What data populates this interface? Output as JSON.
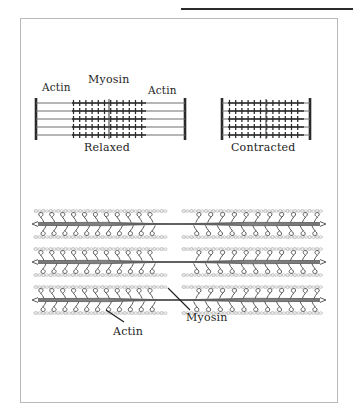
{
  "page": {
    "background_color": "#ffffff",
    "rule_color": "#2b2b2b",
    "frame_color": "#b9b9b9"
  },
  "figure": {
    "frame": {
      "x": 20,
      "y": 18,
      "width": 318,
      "height": 385
    }
  },
  "top_panel": {
    "relaxed": {
      "caption": "Relaxed",
      "labels": {
        "actin_left": "Actin",
        "myosin": "Myosin",
        "actin_right": "Actin"
      },
      "z_line_left_x": 36,
      "z_line_right_x": 185,
      "filament_count": 5,
      "myosin_band": {
        "start_x": 72,
        "end_x": 146
      },
      "m_line_x": 109,
      "line_color": "#6f6f6f",
      "crossbridge_color": "#2a2a2a",
      "z_line_color": "#2a2a2a"
    },
    "contracted": {
      "caption": "Contracted",
      "z_line_left_x": 222,
      "z_line_right_x": 310,
      "filament_count": 5,
      "myosin_band": {
        "start_x": 228,
        "end_x": 304
      },
      "m_line_x": 266
    }
  },
  "detail_panel": {
    "rows": 3,
    "row_y": [
      224,
      262,
      300
    ],
    "left_myosin": {
      "start_x": 38,
      "end_x": 172
    },
    "right_myosin": {
      "start_x": 176,
      "end_x": 320
    },
    "bare_zone_x": 174,
    "myosin_head_pairs_per_half": 11,
    "actin_color": "#c9c9c9",
    "myosin_color": "#595959",
    "labels": {
      "actin": "Actin",
      "myosin": "Myosin"
    },
    "leader_actin": {
      "x1": 106,
      "y1": 310,
      "x2": 124,
      "y2": 322
    },
    "leader_myosin": {
      "x1": 168,
      "y1": 288,
      "x2": 190,
      "y2": 310
    }
  },
  "icons": {
    "sarcomere": "sarcomere-icon",
    "myofilament": "myofilament-icon"
  }
}
